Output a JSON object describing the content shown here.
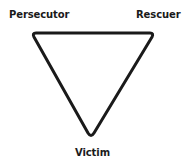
{
  "diagram": {
    "shape": "inverted-triangle",
    "colors": {
      "stroke": "#1a1a1a",
      "text": "#1a1a1a",
      "background": "#ffffff"
    },
    "vertices": [
      {
        "id": "persecutor",
        "label": "Persecutor",
        "position": "top-left"
      },
      {
        "id": "rescuer",
        "label": "Rescuer",
        "position": "top-right"
      },
      {
        "id": "victim",
        "label": "Victim",
        "position": "bottom"
      }
    ]
  }
}
